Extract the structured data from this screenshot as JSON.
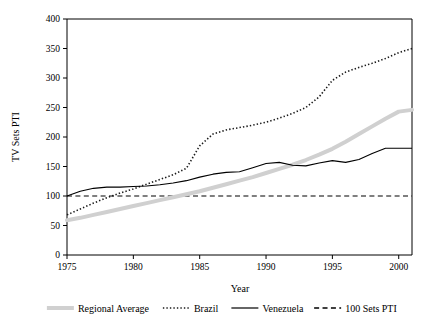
{
  "chart_data": {
    "type": "line",
    "title": "",
    "xlabel": "Year",
    "ylabel": "TV Sets PTI",
    "xlim": [
      1975,
      2001
    ],
    "ylim": [
      0,
      400
    ],
    "xticks": [
      1975,
      1980,
      1985,
      1990,
      1995,
      2000
    ],
    "yticks": [
      0,
      50,
      100,
      150,
      200,
      250,
      300,
      350,
      400
    ],
    "xticklabels": [
      "1975",
      "1980",
      "1985",
      "1990",
      "1995",
      "2000"
    ],
    "yticklabels": [
      "0",
      "50",
      "100",
      "150",
      "200",
      "250",
      "300",
      "350",
      "400"
    ],
    "grid": false,
    "legend_position": "below",
    "x": [
      1975,
      1976,
      1977,
      1978,
      1979,
      1980,
      1981,
      1982,
      1983,
      1984,
      1985,
      1986,
      1987,
      1988,
      1989,
      1990,
      1991,
      1992,
      1993,
      1994,
      1995,
      1996,
      1997,
      1998,
      1999,
      2000,
      2001
    ],
    "series": [
      {
        "name": "Regional Average",
        "style": "thick-solid-gray",
        "color": "#d0d0d0",
        "values": [
          59,
          63,
          68,
          73,
          78,
          83,
          88,
          93,
          98,
          103,
          108,
          114,
          120,
          126,
          132,
          139,
          146,
          153,
          161,
          170,
          180,
          192,
          205,
          218,
          231,
          243,
          246
        ]
      },
      {
        "name": "Brazil",
        "style": "dotted",
        "color": "#1a1a1a",
        "values": [
          68,
          78,
          88,
          97,
          105,
          112,
          120,
          128,
          136,
          147,
          185,
          205,
          212,
          216,
          220,
          225,
          232,
          240,
          250,
          268,
          296,
          310,
          318,
          325,
          333,
          343,
          350
        ]
      },
      {
        "name": "Venezuela",
        "style": "solid",
        "color": "#000000",
        "values": [
          100,
          108,
          113,
          115,
          115,
          116,
          117,
          119,
          122,
          126,
          132,
          137,
          140,
          141,
          148,
          155,
          157,
          152,
          151,
          156,
          160,
          157,
          162,
          172,
          181,
          181,
          181
        ]
      },
      {
        "name": "100 Sets PTI",
        "style": "dashed",
        "color": "#000000",
        "values": [
          100,
          100,
          100,
          100,
          100,
          100,
          100,
          100,
          100,
          100,
          100,
          100,
          100,
          100,
          100,
          100,
          100,
          100,
          100,
          100,
          100,
          100,
          100,
          100,
          100,
          100,
          100
        ]
      }
    ]
  },
  "legend": {
    "items": [
      {
        "label": "Regional Average"
      },
      {
        "label": "Brazil"
      },
      {
        "label": "Venezuela"
      },
      {
        "label": "100 Sets PTI"
      }
    ]
  }
}
